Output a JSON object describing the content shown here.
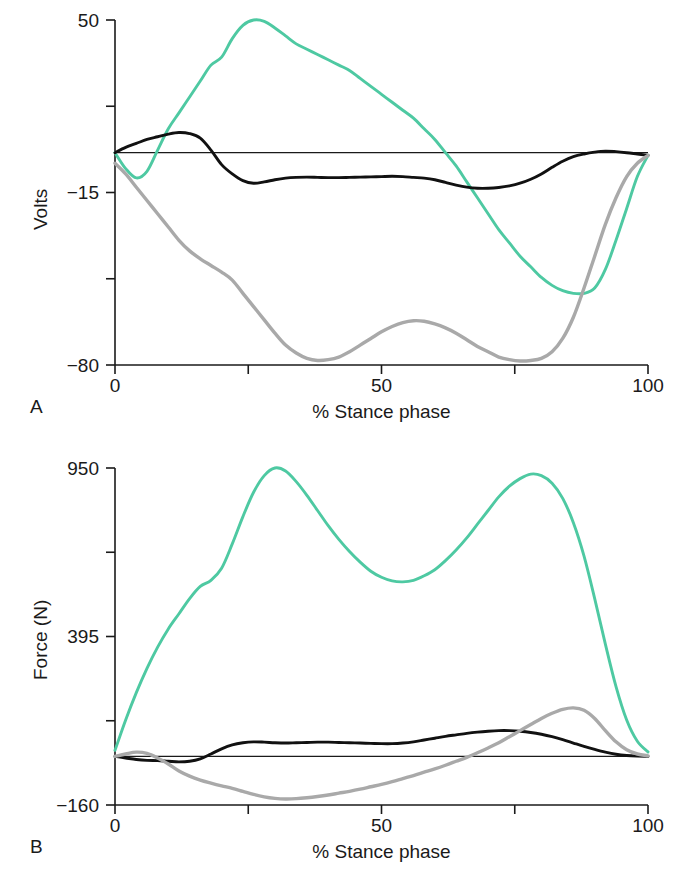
{
  "figure": {
    "panels": [
      {
        "letter": "A",
        "ylabel": "Volts",
        "xlabel": "% Stance phase"
      },
      {
        "letter": "B",
        "ylabel": "Force (N)",
        "xlabel": "% Stance phase"
      }
    ]
  },
  "colors": {
    "green": "#4ec9a2",
    "black": "#111111",
    "gray": "#a9a9a9",
    "axis": "#1a1a1a",
    "background": "#ffffff"
  },
  "chart_data": [
    {
      "type": "line",
      "panel": "A",
      "title": "",
      "xlabel": "% Stance phase",
      "ylabel": "Volts",
      "xlim": [
        0,
        100
      ],
      "ylim": [
        -80,
        50
      ],
      "grid": false,
      "legend": "none",
      "xticks": [
        0,
        25,
        50,
        75,
        100
      ],
      "xtick_labels": [
        "0",
        "",
        "50",
        "",
        "100"
      ],
      "yticks": [
        50,
        17.5,
        -15,
        -47.5,
        -80
      ],
      "ytick_labels": [
        "50",
        "",
        "-15",
        "",
        "-80"
      ],
      "zero_line": 0,
      "x": [
        0,
        2,
        4,
        6,
        8,
        10,
        12,
        14,
        16,
        18,
        20,
        22,
        24,
        26,
        28,
        30,
        32,
        34,
        36,
        38,
        40,
        42,
        44,
        46,
        48,
        50,
        52,
        54,
        56,
        58,
        60,
        62,
        64,
        66,
        68,
        70,
        72,
        74,
        76,
        78,
        80,
        82,
        84,
        86,
        88,
        90,
        92,
        94,
        96,
        98,
        100
      ],
      "series": [
        {
          "name": "green-trace",
          "color": "#4ec9a2",
          "values": [
            0,
            -6,
            -9.5,
            -7,
            1,
            9,
            15,
            21,
            27,
            33,
            36,
            43,
            48,
            50,
            49.5,
            47,
            44,
            41,
            39,
            37,
            35,
            33,
            31,
            28,
            25,
            22,
            19,
            16,
            13,
            9,
            5,
            0,
            -5,
            -11,
            -17,
            -23,
            -29,
            -34,
            -39,
            -43,
            -47,
            -50,
            -52,
            -53,
            -53,
            -51,
            -44,
            -33,
            -21,
            -9,
            -1
          ]
        },
        {
          "name": "black-trace",
          "color": "#111111",
          "values": [
            0,
            2,
            3.5,
            5,
            6,
            7,
            7.6,
            7.2,
            5.5,
            1,
            -4.5,
            -8,
            -10.5,
            -11.5,
            -11,
            -10.2,
            -9.6,
            -9.3,
            -9.2,
            -9.3,
            -9.4,
            -9.4,
            -9.3,
            -9.2,
            -9.1,
            -9.0,
            -8.9,
            -9.0,
            -9.3,
            -9.6,
            -10.2,
            -11.2,
            -12.2,
            -13,
            -13.4,
            -13.4,
            -13.1,
            -12.5,
            -11.5,
            -10,
            -8,
            -5.5,
            -3.2,
            -1.5,
            -0.5,
            0.2,
            0.6,
            0.4,
            0,
            -0.5,
            -1
          ]
        },
        {
          "name": "gray-trace",
          "color": "#a9a9a9",
          "values": [
            -4,
            -8,
            -13,
            -18,
            -23,
            -28,
            -33,
            -37,
            -40,
            -42.5,
            -45,
            -48,
            -53,
            -58,
            -63,
            -68,
            -72.5,
            -75.5,
            -77.5,
            -78.3,
            -78,
            -77,
            -75,
            -72.5,
            -70,
            -67.5,
            -65.5,
            -64,
            -63.3,
            -63.5,
            -64.5,
            -66,
            -68,
            -70.5,
            -73,
            -75,
            -77,
            -78,
            -78.5,
            -78.3,
            -77.5,
            -75,
            -70,
            -62,
            -51,
            -39,
            -27,
            -17,
            -9,
            -4,
            -1
          ]
        }
      ]
    },
    {
      "type": "line",
      "panel": "B",
      "title": "",
      "xlabel": "% Stance phase",
      "ylabel": "Force (N)",
      "xlim": [
        0,
        100
      ],
      "ylim": [
        -160,
        950
      ],
      "grid": false,
      "legend": "none",
      "xticks": [
        0,
        25,
        50,
        75,
        100
      ],
      "xtick_labels": [
        "0",
        "",
        "50",
        "",
        "100"
      ],
      "yticks": [
        950,
        672.5,
        395,
        117.5,
        -160
      ],
      "ytick_labels": [
        "950",
        "",
        "395",
        "",
        "-160"
      ],
      "zero_line": 0,
      "x": [
        0,
        2,
        4,
        6,
        8,
        10,
        12,
        14,
        16,
        18,
        20,
        22,
        24,
        26,
        28,
        30,
        32,
        34,
        36,
        38,
        40,
        42,
        44,
        46,
        48,
        50,
        52,
        54,
        56,
        58,
        60,
        62,
        64,
        66,
        68,
        70,
        72,
        74,
        76,
        78,
        80,
        82,
        84,
        86,
        88,
        90,
        92,
        94,
        96,
        98,
        100
      ],
      "series": [
        {
          "name": "green-trace",
          "color": "#4ec9a2",
          "values": [
            20,
            120,
            210,
            290,
            360,
            420,
            470,
            520,
            560,
            580,
            620,
            700,
            790,
            870,
            925,
            950,
            940,
            905,
            860,
            810,
            760,
            715,
            675,
            640,
            610,
            590,
            578,
            575,
            580,
            595,
            615,
            645,
            680,
            720,
            765,
            810,
            855,
            890,
            915,
            930,
            925,
            900,
            850,
            770,
            660,
            520,
            370,
            230,
            120,
            50,
            15
          ]
        },
        {
          "name": "black-trace",
          "color": "#111111",
          "values": [
            0,
            -5,
            -10,
            -13,
            -14,
            -16,
            -18,
            -16,
            -8,
            8,
            25,
            38,
            45,
            48,
            47,
            45,
            44,
            45,
            46,
            47,
            47,
            46,
            45,
            44,
            43,
            42,
            42,
            44,
            48,
            54,
            60,
            66,
            71,
            76,
            80,
            83,
            85,
            85,
            83,
            79,
            73,
            65,
            55,
            44,
            33,
            23,
            14,
            7,
            3,
            1,
            0
          ]
        },
        {
          "name": "gray-trace",
          "color": "#a9a9a9",
          "values": [
            0,
            8,
            14,
            10,
            -5,
            -25,
            -48,
            -65,
            -78,
            -88,
            -97,
            -105,
            -115,
            -125,
            -133,
            -138,
            -140,
            -139,
            -136,
            -132,
            -127,
            -121,
            -115,
            -108,
            -100,
            -92,
            -83,
            -73,
            -63,
            -52,
            -41,
            -29,
            -16,
            -3,
            12,
            28,
            45,
            65,
            85,
            105,
            125,
            142,
            155,
            160,
            152,
            125,
            85,
            48,
            22,
            8,
            2
          ]
        }
      ]
    }
  ]
}
